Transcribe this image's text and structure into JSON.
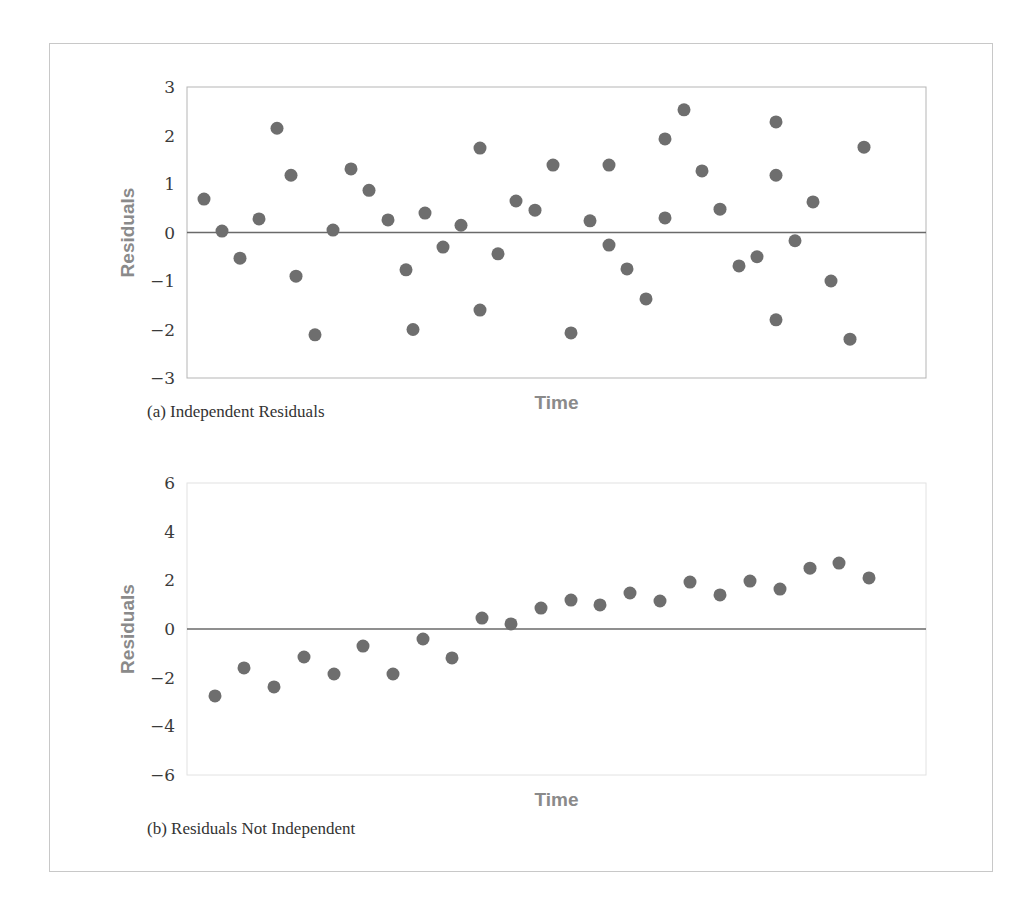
{
  "chart_data": [
    {
      "type": "scatter",
      "title": "",
      "caption": "(a) Independent Residuals",
      "xlabel": "Time",
      "ylabel": "Residuals",
      "ylim": [
        -3,
        3
      ],
      "yticks": [
        "3",
        "2",
        "1",
        "0",
        "−1",
        "−2",
        "−3"
      ],
      "ytick_values": [
        3,
        2,
        1,
        0,
        -1,
        -2,
        -3
      ],
      "reference_line": 0,
      "grid": false,
      "point_color": "#6e6e6e",
      "points": [
        {
          "x": 1,
          "y": 0.69
        },
        {
          "x": 2,
          "y": 0.03
        },
        {
          "x": 3,
          "y": -0.53
        },
        {
          "x": 4,
          "y": 0.28
        },
        {
          "x": 5,
          "y": 2.15
        },
        {
          "x": 6,
          "y": 1.18
        },
        {
          "x": 6.3,
          "y": -0.9
        },
        {
          "x": 7.3,
          "y": -2.11
        },
        {
          "x": 8.3,
          "y": 0.05
        },
        {
          "x": 9.3,
          "y": 1.31
        },
        {
          "x": 10.3,
          "y": 0.87
        },
        {
          "x": 11.3,
          "y": 0.26
        },
        {
          "x": 12.3,
          "y": -0.77
        },
        {
          "x": 12.7,
          "y": -2.0
        },
        {
          "x": 13.3,
          "y": 0.4
        },
        {
          "x": 14.3,
          "y": -0.3
        },
        {
          "x": 15.3,
          "y": 0.15
        },
        {
          "x": 16.3,
          "y": 1.74
        },
        {
          "x": 16.3,
          "y": -1.6
        },
        {
          "x": 17.3,
          "y": -0.44
        },
        {
          "x": 18.3,
          "y": 0.65
        },
        {
          "x": 19.3,
          "y": 0.46
        },
        {
          "x": 20.3,
          "y": 1.39
        },
        {
          "x": 21.3,
          "y": -2.07
        },
        {
          "x": 22.3,
          "y": 0.24
        },
        {
          "x": 23.3,
          "y": 1.39
        },
        {
          "x": 23.3,
          "y": -0.26
        },
        {
          "x": 24.3,
          "y": -0.75
        },
        {
          "x": 25.3,
          "y": -1.37
        },
        {
          "x": 26.3,
          "y": 1.93
        },
        {
          "x": 26.3,
          "y": 0.3
        },
        {
          "x": 27.3,
          "y": 2.53
        },
        {
          "x": 28.3,
          "y": 1.27
        },
        {
          "x": 29.3,
          "y": 0.48
        },
        {
          "x": 30.3,
          "y": -0.69
        },
        {
          "x": 31.3,
          "y": -0.5
        },
        {
          "x": 32.3,
          "y": 2.28
        },
        {
          "x": 32.3,
          "y": 1.18
        },
        {
          "x": 32.3,
          "y": -1.8
        },
        {
          "x": 33.3,
          "y": -0.17
        },
        {
          "x": 34.3,
          "y": 0.63
        },
        {
          "x": 35.3,
          "y": -1.0
        },
        {
          "x": 36.3,
          "y": -2.2
        },
        {
          "x": 37.1,
          "y": 1.76
        }
      ],
      "layout": {
        "box": {
          "left": 187,
          "top": 87,
          "right": 926,
          "bottom": 378
        },
        "px": [
          204,
          222,
          240,
          259,
          277,
          291,
          296,
          315,
          333,
          351,
          369,
          388,
          406,
          413,
          425,
          443,
          461,
          480,
          480,
          498,
          516,
          535,
          553,
          571,
          590,
          609,
          609,
          627,
          646,
          665,
          665,
          684,
          702,
          720,
          739,
          757,
          776,
          776,
          776,
          795,
          813,
          831,
          850,
          864
        ]
      }
    },
    {
      "type": "scatter",
      "title": "",
      "caption": "(b) Residuals Not Independent",
      "xlabel": "Time",
      "ylabel": "Residuals",
      "ylim": [
        -6,
        6
      ],
      "yticks": [
        "6",
        "4",
        "2",
        "0",
        "−2",
        "−4",
        "−6"
      ],
      "ytick_values": [
        6,
        4,
        2,
        0,
        -2,
        -4,
        -6
      ],
      "reference_line": 0,
      "grid": false,
      "point_color": "#6e6e6e",
      "points": [
        {
          "x": 1,
          "y": -2.75
        },
        {
          "x": 2,
          "y": -1.6
        },
        {
          "x": 3,
          "y": -2.38
        },
        {
          "x": 4,
          "y": -1.15
        },
        {
          "x": 5,
          "y": -1.85
        },
        {
          "x": 6,
          "y": -0.7
        },
        {
          "x": 7,
          "y": -1.85
        },
        {
          "x": 8,
          "y": -0.41
        },
        {
          "x": 9,
          "y": -1.19
        },
        {
          "x": 10,
          "y": 0.45
        },
        {
          "x": 11,
          "y": 0.21
        },
        {
          "x": 12,
          "y": 0.86
        },
        {
          "x": 13,
          "y": 1.19
        },
        {
          "x": 14,
          "y": 0.99
        },
        {
          "x": 15,
          "y": 1.48
        },
        {
          "x": 16,
          "y": 1.15
        },
        {
          "x": 17,
          "y": 1.93
        },
        {
          "x": 18,
          "y": 1.4
        },
        {
          "x": 19,
          "y": 1.97
        },
        {
          "x": 20,
          "y": 1.64
        },
        {
          "x": 21,
          "y": 2.5
        },
        {
          "x": 22,
          "y": 2.71
        },
        {
          "x": 23,
          "y": 2.1
        }
      ],
      "layout": {
        "box": {
          "left": 187,
          "top": 483,
          "right": 926,
          "bottom": 775
        },
        "px": [
          215,
          244,
          274,
          304,
          334,
          363,
          393,
          423,
          452,
          482,
          511,
          541,
          571,
          600,
          630,
          660,
          690,
          720,
          750,
          780,
          810,
          839,
          869
        ]
      }
    }
  ]
}
